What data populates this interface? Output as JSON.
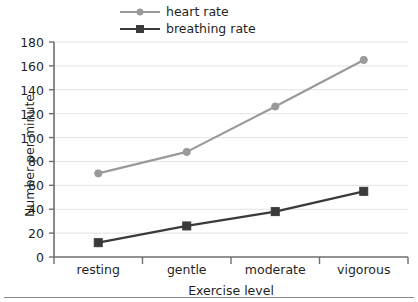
{
  "chart_data": {
    "type": "line",
    "title": "",
    "xlabel": "Exercise level",
    "ylabel": "Number per minute",
    "categories": [
      "resting",
      "gentle",
      "moderate",
      "vigorous"
    ],
    "ylim": [
      0,
      180
    ],
    "yticks": [
      0,
      20,
      40,
      60,
      80,
      100,
      120,
      140,
      160,
      180
    ],
    "grid": true,
    "grid_axis": "y",
    "legend_position": "top-center",
    "series": [
      {
        "name": "heart rate",
        "values": [
          70,
          88,
          126,
          165
        ],
        "color": "#9a9a9a",
        "marker": "circle"
      },
      {
        "name": "breathing rate",
        "values": [
          12,
          26,
          38,
          55
        ],
        "color": "#3a3a3a",
        "marker": "square"
      }
    ]
  },
  "legend": {
    "items": [
      {
        "label": "heart rate"
      },
      {
        "label": "breathing rate"
      }
    ]
  },
  "axes": {
    "y_title": "Number per minute",
    "x_title": "Exercise level",
    "y_tick_labels": [
      "180",
      "160",
      "140",
      "120",
      "100",
      "80",
      "60",
      "40",
      "20",
      "0"
    ],
    "x_tick_labels": [
      "resting",
      "gentle",
      "moderate",
      "vigorous"
    ]
  },
  "colors": {
    "heart_rate": "#9a9a9a",
    "breathing_rate": "#3a3a3a",
    "axis": "#6e6e6e",
    "grid": "#e2e2e2",
    "text": "#1f1f1f",
    "background": "#ffffff"
  }
}
